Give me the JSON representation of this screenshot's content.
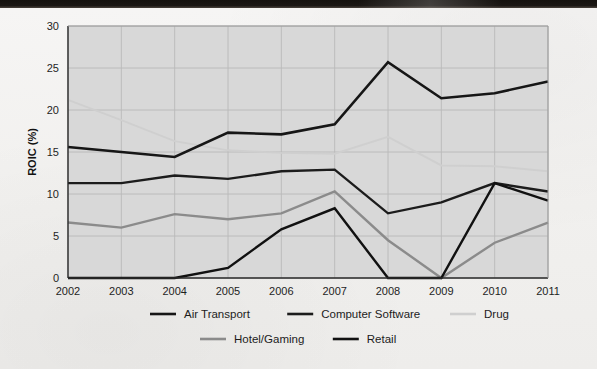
{
  "chart_data": {
    "type": "line",
    "title": "",
    "xlabel": "",
    "ylabel": "ROIC (%)",
    "x": [
      "2002",
      "2003",
      "2004",
      "2005",
      "2006",
      "2007",
      "2008",
      "2009",
      "2010",
      "2011"
    ],
    "categories": [
      "2002",
      "2003",
      "2004",
      "2005",
      "2006",
      "2007",
      "2008",
      "2009",
      "2010",
      "2011"
    ],
    "xlim": [
      2002,
      2011
    ],
    "ylim": [
      0,
      30
    ],
    "yticks": [
      0,
      5,
      10,
      15,
      20,
      25,
      30
    ],
    "ytick_labels": [
      "0",
      "5",
      "10",
      "15",
      "20",
      "25",
      "30"
    ],
    "grid": true,
    "legend_position": "bottom",
    "plot_background": "#d8d8d8",
    "series": [
      {
        "name": "Air Transport",
        "color": "#161616",
        "width": 2.6,
        "values": [
          15.6,
          15.0,
          14.4,
          17.3,
          17.1,
          18.3,
          25.7,
          21.4,
          22.0,
          23.4
        ]
      },
      {
        "name": "Computer Software",
        "color": "#1c1c1c",
        "width": 2.4,
        "values": [
          11.3,
          11.3,
          12.2,
          11.8,
          12.7,
          12.9,
          7.7,
          9.0,
          11.3,
          10.3
        ]
      },
      {
        "name": "Drug",
        "color": "#cfcfcf",
        "width": 1.9,
        "values": [
          21.2,
          18.8,
          16.3,
          15.2,
          14.9,
          14.8,
          16.8,
          13.4,
          13.3,
          12.7
        ]
      },
      {
        "name": "Hotel/Gaming",
        "color": "#8b8b8b",
        "width": 2.4,
        "values": [
          6.6,
          6.0,
          7.6,
          7.0,
          7.7,
          10.3,
          4.5,
          0.0,
          4.2,
          6.6
        ]
      },
      {
        "name": "Retail",
        "color": "#111111",
        "width": 2.4,
        "values": [
          0.0,
          0.0,
          0.0,
          1.2,
          5.8,
          8.3,
          0.0,
          0.0,
          11.3,
          9.2
        ]
      }
    ]
  },
  "legend": {
    "row1": [
      "Air Transport",
      "Computer Software",
      "Drug"
    ],
    "row2": [
      "Hotel/Gaming",
      "Retail"
    ]
  }
}
